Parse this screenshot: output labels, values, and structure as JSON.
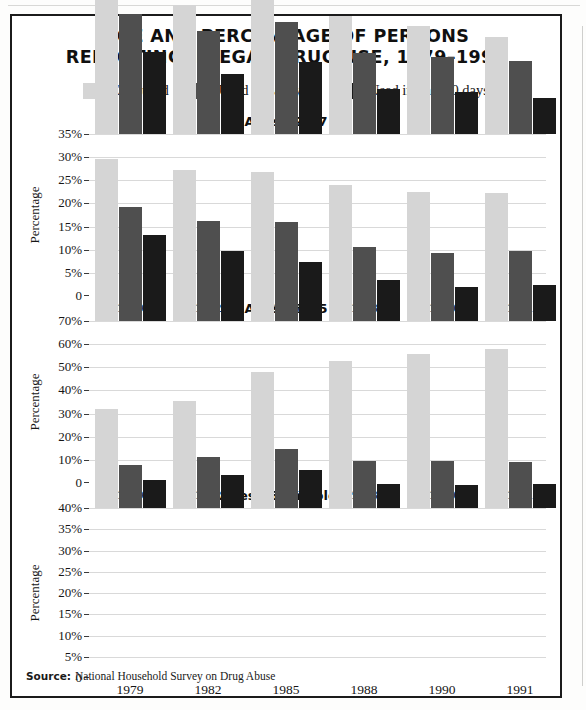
{
  "document": {
    "title_line_1": "AGE AND PERCENTAGE OF PERSONS",
    "title_line_2": "REPORTING ILLEGAL DRUG USE, 1979–1991",
    "source_label": "Source:",
    "source_text": "National Household Survey on Drug Abuse"
  },
  "colors": {
    "ever_used": "#d5d5d5",
    "past_year": "#4f4f4f",
    "past_30_days": "#1a1a1a",
    "grid": "#d9d9d9",
    "axis": "#3a3a3a",
    "frame": "#1b1b1b",
    "text": "#111111"
  },
  "legend": {
    "items": [
      {
        "label": "Ever used",
        "color_key": "ever_used"
      },
      {
        "label": "Used in past year",
        "color_key": "past_year"
      },
      {
        "label": "Used in past 30 days",
        "color_key": "past_30_days"
      }
    ]
  },
  "chart_data": [
    {
      "type": "bar",
      "title": "Ages 12–17",
      "xlabel": "",
      "ylabel": "Percentage",
      "categories": [
        "1979",
        "1982",
        "1985",
        "1988",
        "1990",
        "1991"
      ],
      "ylim": [
        0,
        35
      ],
      "yticks": [
        0,
        5,
        10,
        15,
        20,
        25,
        30,
        35
      ],
      "ytick_labels": [
        "0",
        "5%",
        "10%",
        "15%",
        "20%",
        "25%",
        "30%",
        "35%"
      ],
      "grid": true,
      "legend_position": "top",
      "series": [
        {
          "name": "Ever used",
          "color_key": "ever_used",
          "values": [
            34.5,
            27.8,
            29.8,
            25.5,
            23.3,
            20.9
          ]
        },
        {
          "name": "Used in past year",
          "color_key": "past_year",
          "values": [
            26.0,
            22.3,
            24.2,
            17.4,
            16.6,
            15.8
          ]
        },
        {
          "name": "Used in past 30 days",
          "color_key": "past_30_days",
          "values": [
            17.8,
            13.0,
            15.5,
            9.8,
            9.0,
            7.8
          ]
        }
      ]
    },
    {
      "type": "bar",
      "title": "Ages 18–25",
      "xlabel": "",
      "ylabel": "Percentage",
      "categories": [
        "1979",
        "1982",
        "1985",
        "1988",
        "1990",
        "1991"
      ],
      "ylim": [
        0,
        70
      ],
      "yticks": [
        0,
        10,
        20,
        30,
        40,
        50,
        60,
        70
      ],
      "ytick_labels": [
        "0",
        "10%",
        "20%",
        "30%",
        "40%",
        "50%",
        "60%",
        "70%"
      ],
      "grid": true,
      "legend_position": "top",
      "series": [
        {
          "name": "Ever used",
          "color_key": "ever_used",
          "values": [
            70.0,
            65.3,
            64.3,
            58.9,
            55.8,
            55.4
          ]
        },
        {
          "name": "Used in past year",
          "color_key": "past_year",
          "values": [
            49.4,
            43.4,
            42.6,
            32.0,
            29.2,
            30.2
          ]
        },
        {
          "name": "Used in past 30 days",
          "color_key": "past_30_days",
          "values": [
            37.1,
            30.4,
            25.7,
            17.8,
            14.9,
            15.4
          ]
        }
      ]
    },
    {
      "type": "bar",
      "title": "Ages 26 and older",
      "xlabel": "",
      "ylabel": "Percentage",
      "categories": [
        "1979",
        "1982",
        "1985",
        "1988",
        "1990",
        "1991"
      ],
      "ylim": [
        0,
        40
      ],
      "yticks": [
        0,
        5,
        10,
        15,
        20,
        25,
        30,
        35,
        40
      ],
      "ytick_labels": [
        "0",
        "5%",
        "10%",
        "15%",
        "20%",
        "25%",
        "30%",
        "35%",
        "40%"
      ],
      "grid": true,
      "legend_position": "top",
      "series": [
        {
          "name": "Ever used",
          "color_key": "ever_used",
          "values": [
            23.2,
            25.2,
            31.9,
            34.5,
            36.2,
            37.3
          ]
        },
        {
          "name": "Used in past year",
          "color_key": "past_year",
          "values": [
            10.1,
            12.1,
            13.9,
            11.0,
            11.0,
            10.8
          ]
        },
        {
          "name": "Used in past 30 days",
          "color_key": "past_30_days",
          "values": [
            6.5,
            7.8,
            9.0,
            5.6,
            5.5,
            5.7
          ]
        }
      ]
    }
  ]
}
